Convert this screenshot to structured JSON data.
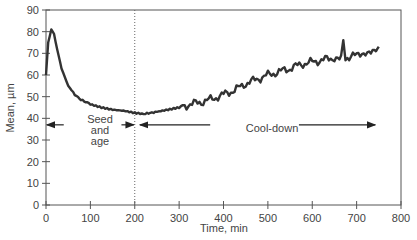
{
  "chart_data": {
    "type": "line",
    "title": "",
    "xlabel": "Time, min",
    "ylabel": "Mean, µm",
    "xlim": [
      0,
      800
    ],
    "ylim": [
      0,
      90
    ],
    "x_ticks": [
      0,
      100,
      200,
      300,
      400,
      500,
      600,
      700,
      800
    ],
    "y_ticks": [
      0,
      10,
      20,
      30,
      40,
      50,
      60,
      70,
      80,
      90
    ],
    "grid": false,
    "legend": null,
    "series": [
      {
        "name": "Mean",
        "color": "#333333",
        "x": [
          0,
          5,
          12,
          18,
          25,
          35,
          50,
          65,
          75,
          90,
          100,
          125,
          150,
          175,
          200,
          220,
          250,
          275,
          300,
          325,
          350,
          375,
          400,
          425,
          450,
          475,
          500,
          525,
          550,
          575,
          600,
          625,
          650,
          665,
          670,
          675,
          700,
          720,
          740,
          750
        ],
        "values": [
          60,
          75,
          81,
          79,
          72,
          63,
          55,
          51,
          49,
          47.5,
          46.5,
          45,
          44,
          43.5,
          42.5,
          42,
          43,
          44,
          45,
          46.5,
          47.5,
          49,
          51,
          53,
          56,
          58,
          60,
          61.5,
          63,
          65,
          66,
          67,
          68,
          69,
          75,
          68,
          69,
          71,
          70,
          73
        ]
      }
    ],
    "annotations": [
      {
        "type": "vline",
        "x": 200,
        "style": "dotted"
      },
      {
        "type": "arrow-double",
        "from_x": 0,
        "to_x": 200,
        "y": 37,
        "label": "Seed and age"
      },
      {
        "type": "arrow-double",
        "from_x": 210,
        "to_x": 745,
        "y": 37,
        "label": "Cool-down"
      }
    ]
  },
  "labels": {
    "ylabel": "Mean, µm",
    "xlabel": "Time, min",
    "seed_line1": "Seed",
    "seed_line2": "and",
    "seed_line3": "age",
    "cooldown": "Cool-down"
  }
}
